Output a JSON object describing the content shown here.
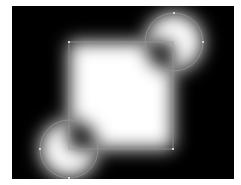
{
  "canvas": {
    "background": "#ffffff",
    "frame": {
      "x": 12,
      "y": 6,
      "width": 222,
      "height": 173,
      "fill": "#000000"
    }
  },
  "shapes": {
    "rect": {
      "x": 69,
      "y": 42,
      "width": 104,
      "height": 107
    },
    "circle_top_right": {
      "cx": 174,
      "cy": 42,
      "r": 29
    },
    "circle_bottom_left": {
      "cx": 69,
      "cy": 149,
      "r": 29
    },
    "blur_std": 9,
    "outline_color": "#9a9a9a",
    "fill_color": "#ffffff"
  }
}
